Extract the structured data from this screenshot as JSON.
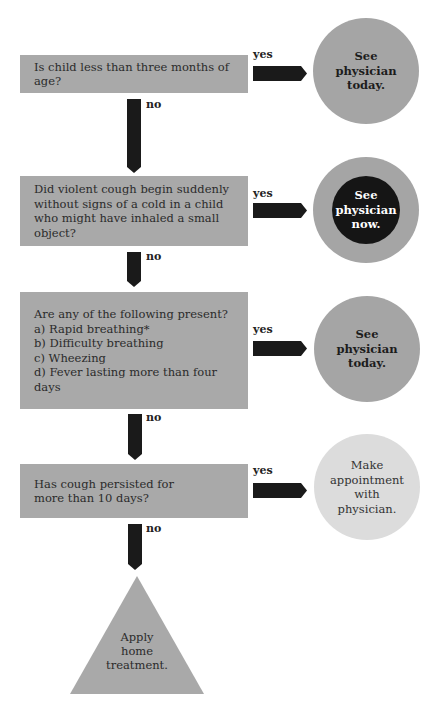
{
  "diagram": {
    "type": "flowchart",
    "topic": "Cough in a child - decision chart",
    "colors": {
      "decision_box": "#a9a9a9",
      "arrow": "#1a1a1a",
      "outcome_today": "#a5a5a5",
      "outcome_now_ring": "#a5a5a5",
      "outcome_now_core": "#151515",
      "outcome_appointment": "#dcdcdc",
      "outcome_home": "#a9a9a9"
    },
    "questions": [
      {
        "text": "Is child less than three months of age?",
        "yes_label": "yes",
        "no_label": "no",
        "outcome": {
          "lines": [
            "See",
            "physician",
            "today."
          ],
          "style": "gray-circle"
        }
      },
      {
        "text": "Did violent cough begin suddenly without signs of a cold in a child who might have inhaled a small object?",
        "yes_label": "yes",
        "no_label": "no",
        "outcome": {
          "lines": [
            "See",
            "physician",
            "now."
          ],
          "style": "black-circle-gray-ring"
        }
      },
      {
        "text": "Are any of the following present?",
        "items": [
          "a)  Rapid breathing*",
          "b)  Difficulty breathing",
          "c)  Wheezing",
          "d)  Fever lasting more than four days"
        ],
        "yes_label": "yes",
        "no_label": "no",
        "outcome": {
          "lines": [
            "See",
            "physician",
            "today."
          ],
          "style": "gray-circle"
        }
      },
      {
        "text": "Has cough persisted for more than 10 days?",
        "yes_label": "yes",
        "no_label": "no",
        "outcome": {
          "lines": [
            "Make",
            "appointment",
            "with",
            "physician."
          ],
          "style": "light-circle"
        }
      }
    ],
    "final": {
      "lines": [
        "Apply",
        "home",
        "treatment."
      ],
      "style": "triangle"
    }
  }
}
